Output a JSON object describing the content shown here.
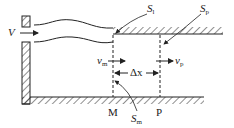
{
  "diagram": {
    "type": "fluid-flow-schematic",
    "labels": {
      "inflow_velocity": "V",
      "surface_l": {
        "base": "S",
        "sub": "l"
      },
      "surface_p": {
        "base": "S",
        "sub": "p"
      },
      "surface_m": {
        "base": "S",
        "sub": "m"
      },
      "velocity_m": {
        "base": "v",
        "sub": "m"
      },
      "velocity_p": {
        "base": "v",
        "sub": "p"
      },
      "spacing": "Δx",
      "section_m": "M",
      "section_p": "P"
    },
    "colors": {
      "stroke": "#222222",
      "background": "#ffffff"
    }
  }
}
